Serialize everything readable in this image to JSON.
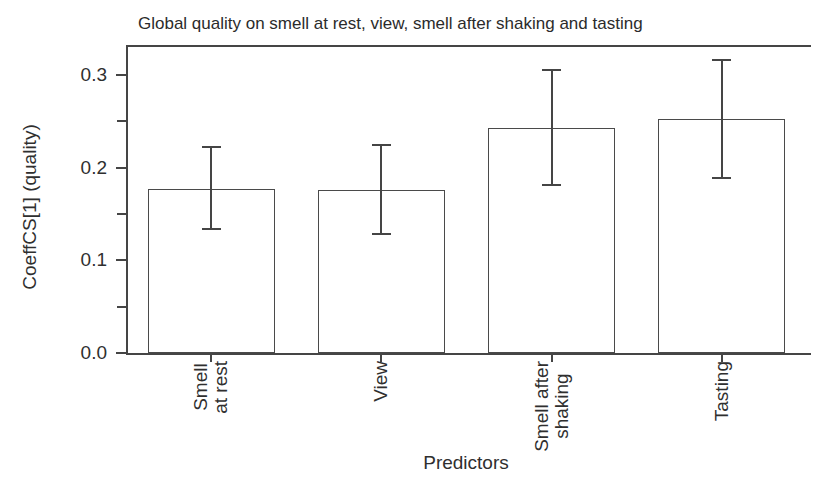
{
  "chart_data": {
    "type": "bar",
    "title": "Global quality on smell at rest, view, smell after shaking and tasting",
    "xlabel": "Predictors",
    "ylabel": "CoeffCS[1] (quality)",
    "categories": [
      "Smell\nat rest",
      "View",
      "Smell after\nshaking",
      "Tasting"
    ],
    "values": [
      0.177,
      0.176,
      0.243,
      0.252
    ],
    "error_low": [
      0.134,
      0.128,
      0.181,
      0.189
    ],
    "error_high": [
      0.222,
      0.224,
      0.305,
      0.316
    ],
    "ylim": [
      0,
      0.33
    ],
    "yticks_major": [
      0,
      0.1,
      0.2,
      0.3
    ],
    "ytick_labels": [
      "0.0",
      "0.1",
      "0.2",
      "0.3"
    ],
    "yticks_minor": [
      0.05,
      0.15,
      0.25
    ],
    "grid": false,
    "legend": null,
    "bar_fill": "#ffffff",
    "line_color": "#454545",
    "text_color": "#2f2f2f"
  }
}
